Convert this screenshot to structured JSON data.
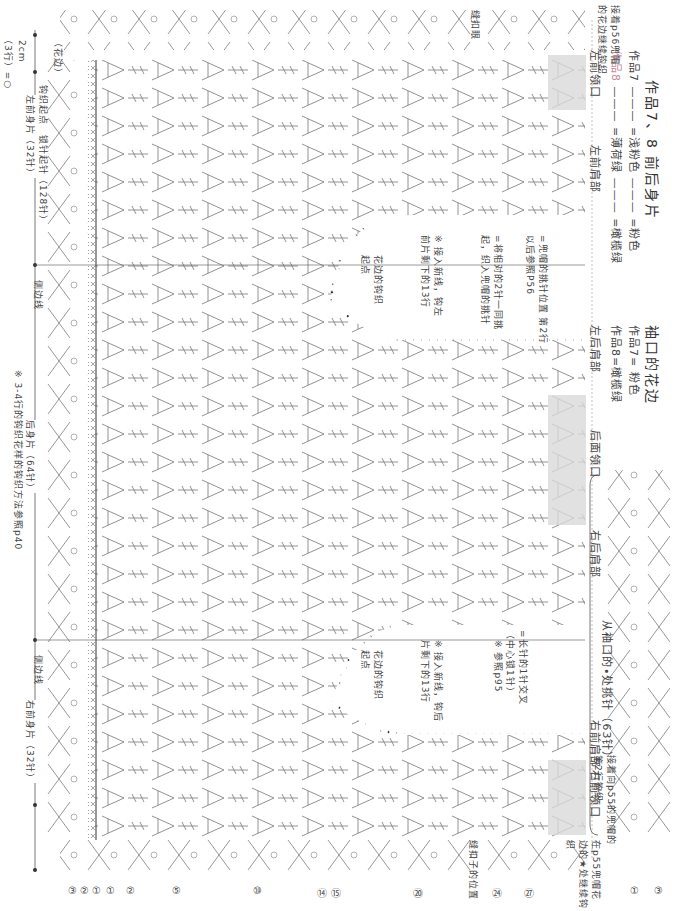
{
  "title": {
    "main": "作品7、8 前后身片",
    "work7_label": "作品7",
    "work7_colors": [
      "=浅粉色",
      "=粉色"
    ],
    "work8_label": "作品8",
    "work8_colors": [
      "=薄荷绿",
      "=橄榄绿"
    ]
  },
  "cuff_edging": {
    "title": "袖口的花边",
    "work7": "作品7= 粉色",
    "work8": "作品8=橄榄绿",
    "pickup_note": "从袖口的•处挑针（63针）"
  },
  "top_markers": [
    "左前领口",
    "左前肩部",
    "左后肩部",
    "后面领口",
    "右后肩部",
    "右前肩部",
    "右前领口"
  ],
  "bottom_labels": {
    "scale": "2cm",
    "scale_rows": "（3行）=○",
    "border": "（花边）",
    "start_point": "钩织起点",
    "chain_start": "锁针起针（128针）",
    "left_front": "左前身片（32针）",
    "side_line_1": "侧边线",
    "back": "后身片（64针）",
    "side_line_2": "侧边线",
    "right_front": "右前身片（32针）",
    "note_pattern": "※ 3-4行的钩织花样的钩织方法参照p40"
  },
  "notes": {
    "hood_pickup_left": "接着p56兜帽的花边继续钩织",
    "hood_pickup_right": "接着向p55的兜帽的第2行钩织",
    "p55_continue": "在p55兜帽花边的★处继续钩织",
    "buttonhole": "缝扣眼",
    "button_position": "缝扣子的位置",
    "legend_hood": "=兜帽的挑针位置 第2行以后参照P56",
    "legend_pair": "=将相对的2针一同挑起，织入兜帽的挑针",
    "left_new_yarn": "※ 接入新线，钩左前片剩下的13行",
    "border_start_left": "花边的钩织起点",
    "cross_stitch": "=长针的1针交叉（中心锁1针）",
    "see_p95": "※ 参照p95",
    "back_new_yarn": "※ 接入新线，钩后片剩下的13行",
    "border_start_right": "花边的钩织起点"
  },
  "row_numbers_bottom": [
    "③",
    "②",
    "①",
    "①",
    "②",
    "⑤",
    "⑩",
    "⑭",
    "⑮",
    "⑳",
    "㉔",
    "㉗",
    "①",
    "③"
  ],
  "row_numbers_inner": [
    "⑬",
    "⑩",
    "⑤",
    "②",
    "①"
  ],
  "colors": {
    "ink": "#555555",
    "shade": "#d9d9d9",
    "pink": "#c88a9a",
    "dot": "#333333"
  }
}
